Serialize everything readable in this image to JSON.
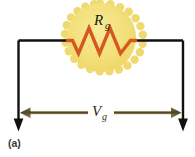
{
  "figure": {
    "panel_label": "(a)",
    "type": "circuit-diagram",
    "width": 195,
    "height": 157
  },
  "resistor": {
    "symbol": "R",
    "subscript": "g",
    "full_label": "Rg",
    "glow_fill": "#f3e07c",
    "glow_edge": "#efd76a",
    "zigzag_color": "#d4581f",
    "name": "generator-resistance"
  },
  "voltage": {
    "symbol": "V",
    "subscript": "g",
    "full_label": "Vg",
    "arrow_color": "#6e6038",
    "name": "generator-voltage"
  },
  "wire": {
    "color": "#111111",
    "name": "circuit-wire"
  },
  "colors": {
    "background": "#ffffff",
    "wire": "#111111",
    "resistor_fill": "#f3e07c",
    "resistor_zigzag": "#d4581f",
    "arrow": "#6e6038",
    "panel_text": "#3b3b3b"
  }
}
